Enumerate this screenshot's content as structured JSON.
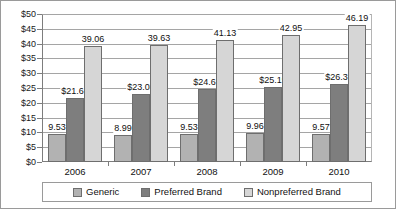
{
  "chart_data": {
    "type": "bar",
    "title": "",
    "xlabel": "",
    "ylabel": "",
    "categories": [
      "2006",
      "2007",
      "2008",
      "2009",
      "2010"
    ],
    "ylim": [
      0,
      50
    ],
    "ytick_step": 5,
    "ytick_labels": [
      "$0",
      "$5",
      "$10",
      "$15",
      "$20",
      "$25",
      "$30",
      "$35",
      "$40",
      "$45",
      "$50"
    ],
    "ytick_values": [
      0,
      5,
      10,
      15,
      20,
      25,
      30,
      35,
      40,
      45,
      50
    ],
    "grid": true,
    "legend_position": "bottom",
    "series": [
      {
        "name": "Generic",
        "color": "#b2b2b2",
        "values": [
          9.53,
          8.99,
          9.53,
          9.96,
          9.57
        ],
        "labels": [
          "9.53",
          "8.99",
          "9.53",
          "9.96",
          "9.57"
        ]
      },
      {
        "name": "Preferred Brand",
        "color": "#7e7e7e",
        "values": [
          21.61,
          23.08,
          24.62,
          25.19,
          26.31
        ],
        "labels": [
          "$21.61",
          "$23.08",
          "$24.62",
          "$25.19",
          "$26.31"
        ]
      },
      {
        "name": "Nonpreferred Brand",
        "color": "#d6d6d6",
        "values": [
          39.06,
          39.63,
          41.13,
          42.95,
          46.19
        ],
        "labels": [
          "39.06",
          "39.63",
          "41.13",
          "42.95",
          "46.19"
        ]
      }
    ]
  }
}
